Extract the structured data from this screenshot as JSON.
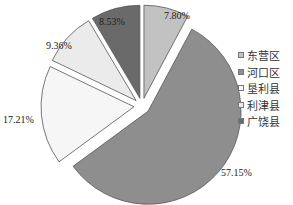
{
  "chart_data": {
    "type": "pie",
    "title": "",
    "exploded": true,
    "start_angle": "12 o'clock",
    "direction": "clockwise",
    "legend_position": "right",
    "categories": [
      "东营区",
      "河口区",
      "垦利县",
      "利津县",
      "广饶县"
    ],
    "values": [
      7.8,
      57.15,
      17.21,
      9.36,
      8.53
    ],
    "labels": [
      "7.80%",
      "57.15%",
      "17.21%",
      "9.36%",
      "8.53%"
    ],
    "colors": [
      "#c2c2c2",
      "#8e8e8e",
      "#f6f6f6",
      "#ebebeb",
      "#6a6a6a"
    ]
  },
  "legend": [
    {
      "label": "东营区"
    },
    {
      "label": "河口区"
    },
    {
      "label": "垦利县"
    },
    {
      "label": "利津县"
    },
    {
      "label": "广饶县"
    }
  ]
}
